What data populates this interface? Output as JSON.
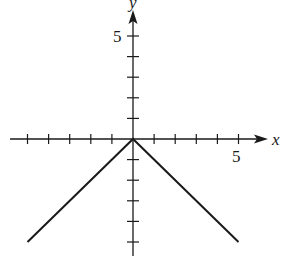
{
  "chart_data": {
    "type": "line",
    "title": "",
    "function": "y = -|x|",
    "xlabel": "x",
    "ylabel": "y",
    "xlim": [
      -6,
      6
    ],
    "ylim": [
      -6,
      6
    ],
    "x_tick_step": 1,
    "y_tick_step": 1,
    "labeled_ticks": {
      "x": [
        5
      ],
      "y": [
        5
      ]
    },
    "tick_labels": {
      "x5": "5",
      "y5": "5"
    },
    "grid": false,
    "legend": null,
    "series": [
      {
        "name": "y = -|x|",
        "x": [
          -5,
          0,
          5
        ],
        "y": [
          -5,
          0,
          -5
        ]
      }
    ]
  },
  "colors": {
    "axis": "#1a1a1a",
    "line": "#1a1a1a",
    "background": "#ffffff"
  }
}
